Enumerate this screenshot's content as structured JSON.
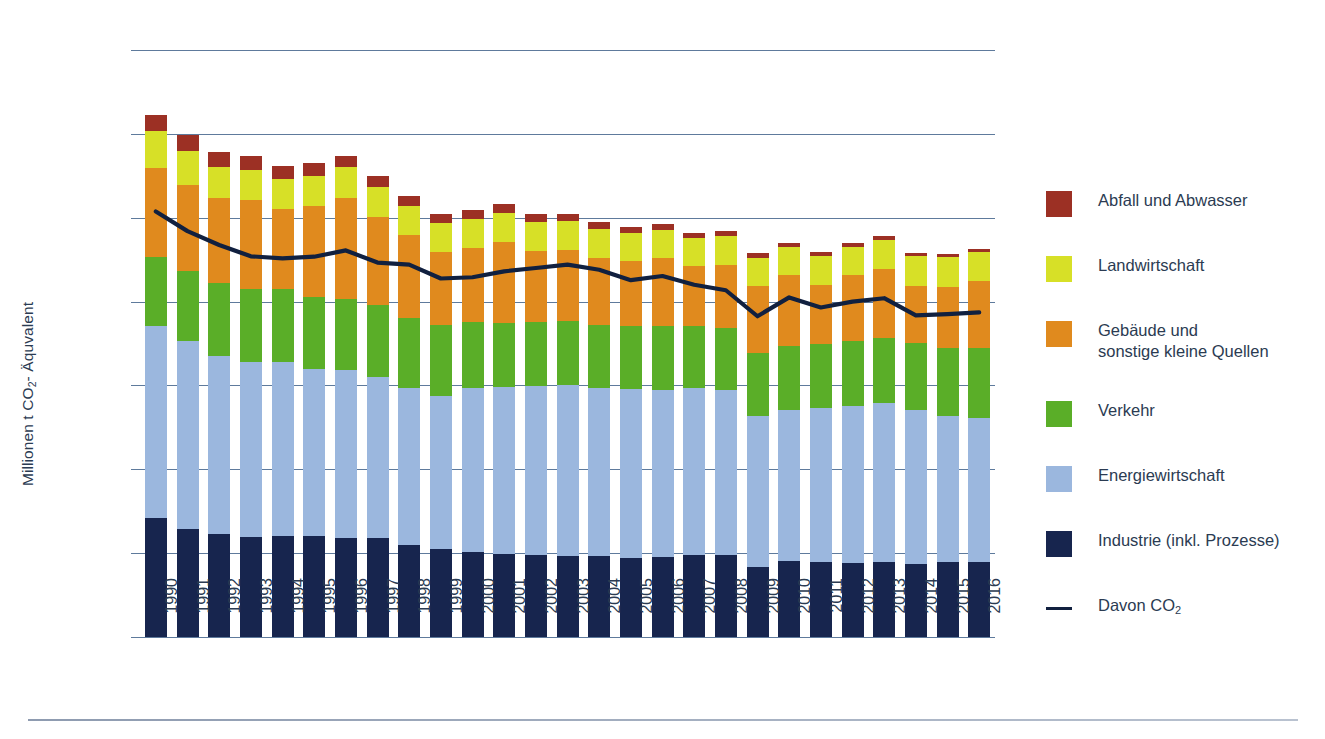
{
  "axes": {
    "y_title_main": "Millionen t CO",
    "y_title_sub": "2",
    "y_title_tail": "- Äquvalent",
    "y_ticks": [
      "1.400",
      "1.200",
      "1.000",
      "800",
      "600",
      "400",
      "200",
      "0"
    ]
  },
  "legend": {
    "items": [
      {
        "label": "Abfall und Abwasser",
        "color": "#9c3024",
        "type": "swatch"
      },
      {
        "label": "Landwirtschaft",
        "color": "#d7e027",
        "type": "swatch"
      },
      {
        "label": "Gebäude und\nsonstige kleine Quellen",
        "color": "#e08a1e",
        "type": "swatch"
      },
      {
        "label": "Verkehr",
        "color": "#5aae28",
        "type": "swatch"
      },
      {
        "label": "Energiewirtschaft",
        "color": "#9bb7de",
        "type": "swatch"
      },
      {
        "label": "Industrie (inkl. Prozesse)",
        "color": "#17254e",
        "type": "swatch"
      }
    ],
    "line_item": {
      "label_main": "Davon CO",
      "label_sub": "2",
      "color": "#11203f",
      "type": "line"
    }
  },
  "chart_data": {
    "type": "bar",
    "title": "",
    "xlabel": "",
    "ylabel": "Millionen t CO2- Äquvalent",
    "ylim": [
      0,
      1400
    ],
    "ytick_values": [
      0,
      200,
      400,
      600,
      800,
      1000,
      1200,
      1400
    ],
    "grid": true,
    "stacked": true,
    "legend_position": "right",
    "categories": [
      "1990",
      "1991",
      "1992",
      "1993",
      "1994",
      "1995",
      "1996",
      "1997",
      "1998",
      "1999",
      "2000",
      "2001",
      "2002",
      "2003",
      "2004",
      "2005",
      "2006",
      "2007",
      "2008",
      "2009",
      "2010",
      "2011",
      "2012",
      "2013",
      "2014",
      "2015",
      "2016"
    ],
    "series": [
      {
        "name": "Industrie (inkl. Prozesse)",
        "color": "#17254e",
        "values": [
          283,
          257,
          246,
          238,
          242,
          241,
          236,
          237,
          219,
          209,
          203,
          199,
          196,
          194,
          194,
          188,
          190,
          195,
          196,
          166,
          181,
          180,
          177,
          178,
          173,
          179,
          180
        ]
      },
      {
        "name": "Energiewirtschaft",
        "color": "#9bb7de",
        "values": [
          459,
          450,
          425,
          417,
          413,
          399,
          400,
          384,
          374,
          367,
          390,
          397,
          403,
          408,
          399,
          404,
          400,
          400,
          392,
          360,
          361,
          367,
          375,
          380,
          368,
          348,
          343
        ]
      },
      {
        "name": "Verkehr",
        "color": "#5aae28",
        "values": [
          164,
          165,
          174,
          176,
          175,
          172,
          171,
          170,
          167,
          167,
          158,
          153,
          153,
          152,
          152,
          149,
          151,
          148,
          148,
          151,
          151,
          152,
          154,
          156,
          160,
          163,
          166
        ]
      },
      {
        "name": "Gebäude und sonstige kleine Quellen",
        "color": "#e08a1e",
        "values": [
          213,
          205,
          203,
          212,
          190,
          215,
          241,
          210,
          198,
          175,
          176,
          194,
          168,
          170,
          160,
          156,
          163,
          141,
          152,
          161,
          170,
          141,
          157,
          164,
          137,
          146,
          159
        ]
      },
      {
        "name": "Landwirtschaft",
        "color": "#d7e027",
        "values": [
          88,
          82,
          74,
          72,
          72,
          73,
          72,
          72,
          71,
          70,
          70,
          69,
          69,
          68,
          68,
          67,
          67,
          67,
          68,
          67,
          67,
          68,
          68,
          69,
          70,
          70,
          70
        ]
      },
      {
        "name": "Abfall und Abwasser",
        "color": "#9c3024",
        "values": [
          38,
          38,
          34,
          33,
          32,
          30,
          27,
          26,
          24,
          22,
          21,
          20,
          19,
          18,
          17,
          15,
          14,
          13,
          12,
          11,
          10,
          10,
          9,
          9,
          8,
          8,
          8
        ]
      }
    ],
    "line_series": {
      "name": "Davon CO2",
      "color": "#11203f",
      "values": [
        1015,
        968,
        935,
        908,
        903,
        907,
        922,
        893,
        888,
        855,
        858,
        872,
        880,
        888,
        876,
        851,
        861,
        840,
        827,
        765,
        810,
        786,
        800,
        808,
        767,
        770,
        774
      ]
    }
  }
}
